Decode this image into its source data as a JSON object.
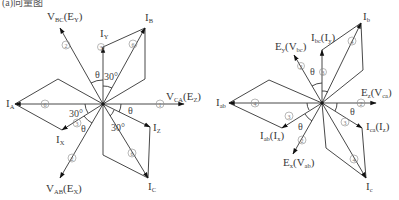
{
  "corner_text": "(a)向量图",
  "colors": {
    "line": "#333333",
    "text": "#3a3a3a",
    "circle_num": "#888888"
  },
  "left_diagram": {
    "labels": {
      "vbc_main": "V",
      "vbc_sub": "BC",
      "vbc_paren": "(E",
      "vbc_psub": "Y",
      "vbc_close": ")",
      "iy_main": "I",
      "iy_sub": "Y",
      "ib_main": "I",
      "ib_sub": "B",
      "vca_main": "V",
      "vca_sub": "CA",
      "vca_paren": "(E",
      "vca_psub": "Z",
      "vca_close": ")",
      "ia_main": "I",
      "ia_sub": "A",
      "ix_main": "I",
      "ix_sub": "X",
      "vab_main": "V",
      "vab_sub": "AB",
      "vab_paren": "(E",
      "vab_psub": "X",
      "vab_close": ")",
      "iz_main": "I",
      "iz_sub": "Z",
      "ic_main": "I",
      "ic_sub": "C"
    },
    "angles": {
      "theta": "θ",
      "thirty": "30°"
    },
    "circle_numbers": {
      "n1": "1",
      "n2": "2",
      "n3": "3",
      "n6": "6"
    }
  },
  "right_diagram": {
    "labels": {
      "ey_main": "E",
      "ey_sub": "y",
      "ey_paren": "(V",
      "ey_psub": "bc",
      "ey_close": ")",
      "ibc_main": "I",
      "ibc_sub": "bc",
      "ibc_paren": "(I",
      "ibc_psub": "y",
      "ibc_close": ")",
      "ib_main": "I",
      "ib_sub": "b",
      "ez_main": "E",
      "ez_sub": "z",
      "ez_paren": "(V",
      "ez_psub": "ca",
      "ez_close": ")",
      "iab_main": "I",
      "iab_sub": "ab",
      "iabx_main": "I",
      "iabx_sub": "ab",
      "iabx_paren": "(I",
      "iabx_psub": "x",
      "iabx_close": ")",
      "ex_main": "E",
      "ex_sub": "x",
      "ex_paren": "(V",
      "ex_psub": "ab",
      "ex_close": ")",
      "ica_main": "I",
      "ica_sub": "ca",
      "ica_paren": "(I",
      "ica_psub": "z",
      "ica_close": ")",
      "ic_main": "I",
      "ic_sub": "c"
    },
    "angles": {
      "theta": "θ"
    },
    "circle_numbers": {
      "n2": "2",
      "n3": "3",
      "n4": "4"
    }
  }
}
